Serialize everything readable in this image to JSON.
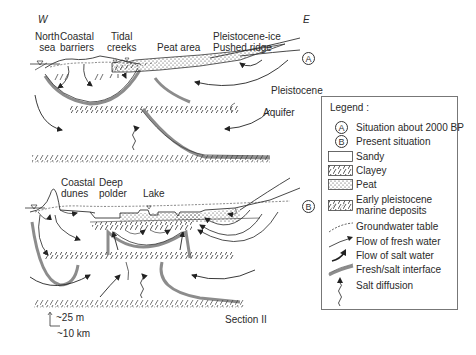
{
  "section_a": {
    "compass_west": "W",
    "compass_east": "E",
    "marker": "A",
    "labels": {
      "north_sea": [
        "North",
        "sea"
      ],
      "coastal_barriers": [
        "Coastal",
        "barriers"
      ],
      "tidal_creeks": [
        "Tidal",
        "creeks"
      ],
      "peat_area": "Peat area",
      "pushed_ridge": [
        "Pleistocene-ice",
        "Pushed ridge"
      ],
      "pleistocene": "Pleistocene",
      "aquifer": "Aquifer"
    }
  },
  "section_b": {
    "marker": "B",
    "labels": {
      "coastal_dunes": [
        "Coastal",
        "dunes"
      ],
      "deep_polder": [
        "Deep",
        "polder"
      ],
      "lake": "Lake"
    },
    "section_name": "Section II"
  },
  "scale": {
    "vertical": "~25 m",
    "horizontal": "~10 km"
  },
  "legend": {
    "title": "Legend :",
    "items": [
      {
        "symbol": "circle-a",
        "label": "Situation about 2000 BP"
      },
      {
        "symbol": "circle-b",
        "label": "Present situation"
      },
      {
        "symbol": "sandy-box",
        "label": "Sandy"
      },
      {
        "symbol": "clayey-box",
        "label": "Clayey"
      },
      {
        "symbol": "peat-box",
        "label": "Peat"
      },
      {
        "symbol": "marine-box",
        "label": [
          "Early pleistocene",
          "marine deposits"
        ]
      },
      {
        "symbol": "dashed-line",
        "label": "Groundwater table"
      },
      {
        "symbol": "thin-arrow",
        "label": "Flow of fresh water"
      },
      {
        "symbol": "bold-arrow",
        "label": "Flow of salt water"
      },
      {
        "symbol": "grey-band",
        "label": "Fresh/salt interface"
      },
      {
        "symbol": "wavy-arrow",
        "label": "Salt diffusion"
      }
    ]
  },
  "colors": {
    "line": "#2a2a2a",
    "interface": "#8c8c8c",
    "interface_light": "#bdbdbd",
    "background": "#ffffff"
  }
}
